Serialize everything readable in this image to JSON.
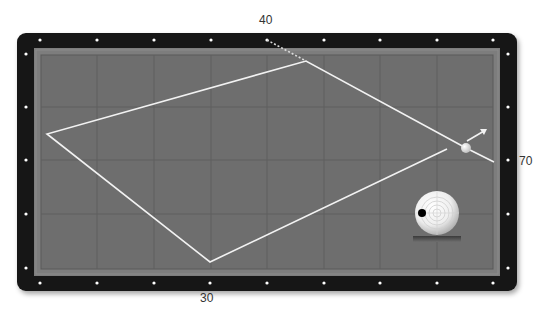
{
  "diagram": {
    "type": "billiards-three-cushion-path",
    "labels": {
      "top": "40",
      "bottom": "30",
      "right": "70"
    },
    "colors": {
      "frame": "#141414",
      "cushion": "#7d7d7d",
      "cloth": "#6e6e6e",
      "grid": "#5f5f5f",
      "path": "#f2f2f2",
      "diamond": "#ffffff",
      "ball": "#f5f5f5",
      "label_text": "#333333"
    },
    "table": {
      "frame": {
        "x": 17,
        "y": 33,
        "w": 500,
        "h": 258,
        "r": 9
      },
      "cushion": {
        "x": 34,
        "y": 48,
        "w": 466,
        "h": 228
      },
      "cloth": {
        "x": 41,
        "y": 55,
        "w": 452,
        "h": 214
      },
      "grid_x": [
        97,
        154,
        211,
        267,
        324,
        380,
        437
      ],
      "grid_y": [
        107,
        160,
        214
      ],
      "diamonds_top_x": [
        40,
        97,
        154,
        211,
        267,
        324,
        380,
        437,
        493
      ],
      "diamonds_bottom_x": [
        40,
        97,
        154,
        210,
        267,
        324,
        380,
        437,
        493
      ],
      "diamonds_side_y": [
        54,
        107,
        160,
        214,
        268
      ],
      "diamonds_top_y": 40,
      "diamonds_bottom_y": 283,
      "diamonds_left_x": 26,
      "diamonds_right_x": 508
    },
    "path": {
      "aim_line": {
        "from": [
          267,
          40
        ],
        "to": [
          306,
          61
        ]
      },
      "segments": [
        [
          494,
          162
        ],
        [
          466,
          148
        ],
        [
          306,
          61
        ],
        [
          47,
          134
        ],
        [
          210,
          262
        ],
        [
          447,
          149
        ]
      ]
    },
    "cue_ball": {
      "cx": 466,
      "cy": 148,
      "r": 5
    },
    "direction_arrow": {
      "from": [
        467,
        141
      ],
      "to": [
        487,
        129
      ]
    },
    "spin_indicator": {
      "ball": {
        "cx": 437,
        "cy": 213,
        "r": 22
      },
      "rings": [
        4,
        8,
        12,
        16
      ],
      "contact_dot": {
        "cx": 422,
        "cy": 213,
        "r": 4
      },
      "base_bar": {
        "x": 413,
        "y": 236,
        "w": 48,
        "h": 6
      }
    }
  }
}
